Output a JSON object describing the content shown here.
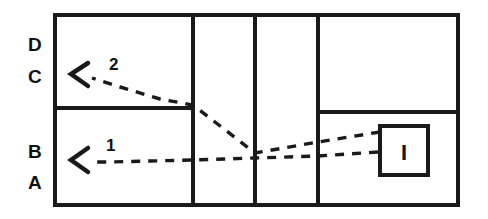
{
  "diagram": {
    "stroke_color": "#1a1a1a",
    "background_color": "#ffffff",
    "outer_frame": {
      "name": "outer-rectangle",
      "x": 55,
      "y": 15,
      "width": 403,
      "height": 190,
      "stroke_width": 4
    },
    "vertical_dividers": [
      {
        "name": "vertical-divider-1",
        "x": 193,
        "stroke_width": 4
      },
      {
        "name": "vertical-divider-2",
        "x": 255,
        "stroke_width": 4
      },
      {
        "name": "vertical-divider-3",
        "x": 318,
        "stroke_width": 4
      }
    ],
    "horizontal_dividers": [
      {
        "name": "horizontal-divider-left",
        "x1": 55,
        "x2": 193,
        "y": 108,
        "stroke_width": 4
      },
      {
        "name": "horizontal-divider-right",
        "x1": 318,
        "x2": 458,
        "y": 112,
        "stroke_width": 4
      }
    ],
    "inner_box": {
      "name": "inner-box",
      "x": 380,
      "y": 126,
      "width": 48,
      "height": 49,
      "stroke_width": 4,
      "glyph": "I"
    },
    "row_labels": [
      {
        "name": "row-label-d",
        "text": "D",
        "x": 28,
        "y": 51
      },
      {
        "name": "row-label-c",
        "text": "C",
        "x": 28,
        "y": 83
      },
      {
        "name": "row-label-b",
        "text": "B",
        "x": 28,
        "y": 158
      },
      {
        "name": "row-label-a",
        "text": "A",
        "x": 28,
        "y": 189
      }
    ],
    "flows": [
      {
        "name": "flow-arrow-2",
        "label": "2",
        "label_x": 109,
        "label_y": 70,
        "dash_pattern": "9,8",
        "dash_width": 3.4,
        "path": "M 380 132 L 318 142 L 255 153 L 193 105 L 160 99 L 120 87 L 92 78",
        "arrowhead": {
          "tip_x": 71,
          "tip_y": 74,
          "back_x": 88,
          "back_y": 63,
          "back2_x": 88,
          "back2_y": 86
        }
      },
      {
        "name": "flow-arrow-1",
        "label": "1",
        "label_x": 106,
        "label_y": 151,
        "dash_pattern": "9,8",
        "dash_width": 3.4,
        "path": "M 378 152 L 318 156 L 255 158 L 193 160 L 150 161 L 110 162 L 92 162",
        "arrowhead": {
          "tip_x": 71,
          "tip_y": 160,
          "back_x": 88,
          "back_y": 148,
          "back2_x": 88,
          "back2_y": 172
        }
      }
    ]
  }
}
